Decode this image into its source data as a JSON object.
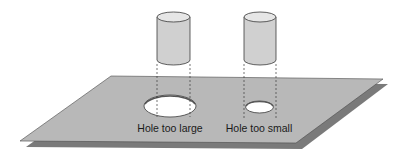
{
  "diagram": {
    "labels": {
      "large_hole": "Hole too large",
      "small_hole": "Hole too small"
    },
    "colors": {
      "plate": "#b8b8b8",
      "plate_shadow": "#7a7a7a",
      "cylinder": "#d0d0d0",
      "cylinder_top": "#e6e6e6",
      "hole": "#ffffff",
      "outline": "#3a3a3a"
    }
  }
}
